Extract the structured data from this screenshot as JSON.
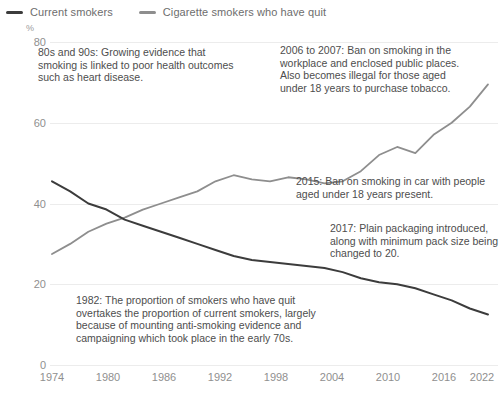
{
  "legend": {
    "items": [
      {
        "label": "Current smokers",
        "color": "#3c3c3c",
        "icon": "line-swatch-icon"
      },
      {
        "label": "Cigarette smokers who have quit",
        "color": "#8e8e8e",
        "icon": "line-swatch-icon"
      }
    ]
  },
  "axes": {
    "y_unit_label": "%",
    "y_ticks": [
      "0",
      "20",
      "40",
      "60",
      "80"
    ],
    "x_ticks": [
      "1974",
      "1980",
      "1986",
      "1992",
      "1998",
      "2004",
      "2010",
      "2016",
      "2022"
    ]
  },
  "annotations": {
    "a1": "80s and 90s: Growing evidence that smoking is linked to poor health outcomes such as heart disease.",
    "a2": "2006 to 2007: Ban on smoking in the workplace and enclosed public places. Also becomes illegal for those aged under 18 years to purchase tobacco.",
    "a3": "2015: Ban on smoking in car with people aged under 18 years present.",
    "a4": "2017: Plain packaging introduced, along with minimum pack size being changed to 20.",
    "a5": "1982: The proportion of smokers who have quit overtakes the proportion of current smokers, largely because of mounting anti-smoking evidence and campaigning which took place in the early 70s."
  },
  "chart_data": {
    "type": "line",
    "title": "",
    "subtitle": "",
    "xlabel": "",
    "ylabel": "%",
    "xlim": [
      1974,
      2022
    ],
    "ylim": [
      0,
      80
    ],
    "ytick_values": [
      0,
      20,
      40,
      60,
      80
    ],
    "xtick_values": [
      1974,
      1980,
      1986,
      1992,
      1998,
      2004,
      2010,
      2016,
      2022
    ],
    "grid": true,
    "legend_position": "top-left",
    "x": [
      1974,
      1976,
      1978,
      1980,
      1982,
      1984,
      1986,
      1988,
      1990,
      1992,
      1994,
      1996,
      1998,
      2000,
      2002,
      2004,
      2006,
      2008,
      2010,
      2012,
      2014,
      2016,
      2018,
      2020,
      2022
    ],
    "series": [
      {
        "name": "Current smokers",
        "color": "#3c3c3c",
        "values": [
          45.5,
          43.0,
          40.0,
          38.5,
          36.0,
          34.5,
          33.0,
          31.5,
          30.0,
          28.5,
          27.0,
          26.0,
          25.5,
          25.0,
          24.5,
          24.0,
          23.0,
          21.5,
          20.5,
          20.0,
          19.0,
          17.5,
          16.0,
          14.0,
          12.5
        ]
      },
      {
        "name": "Cigarette smokers who have quit",
        "color": "#8e8e8e",
        "values": [
          27.5,
          30.0,
          33.0,
          35.0,
          36.5,
          38.5,
          40.0,
          41.5,
          43.0,
          45.5,
          47.0,
          46.0,
          45.5,
          46.5,
          46.0,
          45.0,
          45.5,
          48.0,
          52.0,
          54.0,
          52.5,
          57.0,
          60.0,
          64.0,
          69.5
        ]
      }
    ],
    "annotations": [
      {
        "text": "80s and 90s: Growing evidence that smoking is linked to poor health outcomes such as heart disease.",
        "x": 1977,
        "y": 76
      },
      {
        "text": "2006 to 2007: Ban on smoking in the workplace and enclosed public places. Also becomes illegal for those aged under 18 years to purchase tobacco.",
        "x": 2004,
        "y": 76
      },
      {
        "text": "2015: Ban on smoking in car with people aged under 18 years present.",
        "x": 2006,
        "y": 44
      },
      {
        "text": "2017: Plain packaging introduced, along with minimum pack size being changed to 20.",
        "x": 2010,
        "y": 32
      },
      {
        "text": "1982: The proportion of smokers who have quit overtakes the proportion of current smokers, largely because of mounting anti-smoking evidence and campaigning which took place in the early 70s.",
        "x": 1980,
        "y": 14
      }
    ]
  }
}
